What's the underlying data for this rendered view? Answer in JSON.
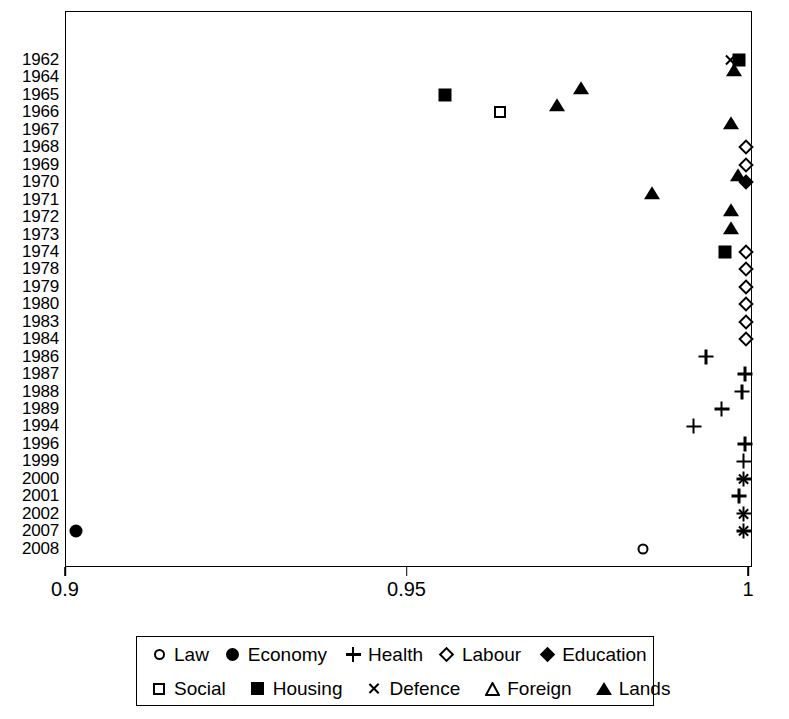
{
  "chart_data": {
    "type": "scatter",
    "title": "",
    "xlabel": "",
    "ylabel": "",
    "xlim": [
      0.9,
      1.0
    ],
    "ylim_categories": true,
    "grid": false,
    "legend_position": "bottom",
    "xticks": [
      {
        "value": 0.9,
        "label": "0.9"
      },
      {
        "value": 0.95,
        "label": "0.95"
      },
      {
        "value": 1.0,
        "label": "1"
      }
    ],
    "categories": [
      "1962",
      "1964",
      "1965",
      "1966",
      "1967",
      "1968",
      "1969",
      "1970",
      "1971",
      "1972",
      "1973",
      "1974",
      "1978",
      "1979",
      "1980",
      "1983",
      "1984",
      "1986",
      "1987",
      "1988",
      "1989",
      "1994",
      "1996",
      "1999",
      "2000",
      "2001",
      "2002",
      "2007",
      "2008"
    ],
    "series": [
      {
        "name": "Law",
        "marker": "circle-open",
        "points": [
          {
            "y": "2008",
            "x": 0.9845
          }
        ]
      },
      {
        "name": "Economy",
        "marker": "circle-fill",
        "points": [
          {
            "y": "2007",
            "x": 0.9015
          }
        ]
      },
      {
        "name": "Health",
        "marker": "plus",
        "points": [
          {
            "y": "1986",
            "x": 0.9937
          },
          {
            "y": "1987",
            "x": 0.9994
          },
          {
            "y": "1988",
            "x": 0.999
          },
          {
            "y": "1989",
            "x": 0.996
          },
          {
            "y": "1994",
            "x": 0.9919
          },
          {
            "y": "1996",
            "x": 0.9994
          },
          {
            "y": "1999",
            "x": 0.9992
          },
          {
            "y": "2000",
            "x": 0.9992
          },
          {
            "y": "2001",
            "x": 0.9985
          },
          {
            "y": "2002",
            "x": 0.9992
          },
          {
            "y": "2007",
            "x": 0.9992
          }
        ]
      },
      {
        "name": "Labour",
        "marker": "diamond-open",
        "points": [
          {
            "y": "1968",
            "x": 0.9996
          },
          {
            "y": "1969",
            "x": 0.9996
          },
          {
            "y": "1974",
            "x": 0.9996
          },
          {
            "y": "1978",
            "x": 0.9996
          },
          {
            "y": "1979",
            "x": 0.9996
          },
          {
            "y": "1980",
            "x": 0.9996
          },
          {
            "y": "1983",
            "x": 0.9996
          },
          {
            "y": "1984",
            "x": 0.9996
          }
        ]
      },
      {
        "name": "Education",
        "marker": "diamond-fill",
        "points": [
          {
            "y": "1970",
            "x": 0.9996
          }
        ]
      },
      {
        "name": "Social",
        "marker": "square-open",
        "points": [
          {
            "y": "1966",
            "x": 0.9635
          }
        ]
      },
      {
        "name": "Housing",
        "marker": "square-fill",
        "points": [
          {
            "y": "1962",
            "x": 0.9985
          },
          {
            "y": "1965",
            "x": 0.9555
          },
          {
            "y": "1974",
            "x": 0.9965
          }
        ]
      },
      {
        "name": "Defence",
        "marker": "cross",
        "points": [
          {
            "y": "1962",
            "x": 0.9973
          },
          {
            "y": "2000",
            "x": 0.9992
          },
          {
            "y": "2002",
            "x": 0.9992
          },
          {
            "y": "2007",
            "x": 0.9992
          }
        ]
      },
      {
        "name": "Foreign",
        "marker": "triangle-open",
        "points": []
      },
      {
        "name": "Lands",
        "marker": "triangle-fill",
        "points": [
          {
            "y": "1964",
            "x": 0.999
          },
          {
            "y": "1965",
            "x": 0.9766
          },
          {
            "y": "1966",
            "x": 0.973
          },
          {
            "y": "1967",
            "x": 0.9985
          },
          {
            "y": "1970",
            "x": 0.9996
          },
          {
            "y": "1971",
            "x": 0.987
          },
          {
            "y": "1972",
            "x": 0.9986
          },
          {
            "y": "1973",
            "x": 0.9986
          }
        ]
      }
    ]
  },
  "legend": {
    "row1": [
      {
        "label": "Law",
        "marker": "circle-open"
      },
      {
        "label": "Economy",
        "marker": "circle-fill"
      },
      {
        "label": "Health",
        "marker": "plus"
      },
      {
        "label": "Labour",
        "marker": "diamond-open"
      },
      {
        "label": "Education",
        "marker": "diamond-fill"
      }
    ],
    "row2": [
      {
        "label": "Social",
        "marker": "square-open"
      },
      {
        "label": "Housing",
        "marker": "square-fill"
      },
      {
        "label": "Defence",
        "marker": "cross"
      },
      {
        "label": "Foreign",
        "marker": "triangle-open"
      },
      {
        "label": "Lands",
        "marker": "triangle-fill"
      }
    ]
  },
  "colors": {
    "foreground": "#000000",
    "background": "#ffffff"
  }
}
